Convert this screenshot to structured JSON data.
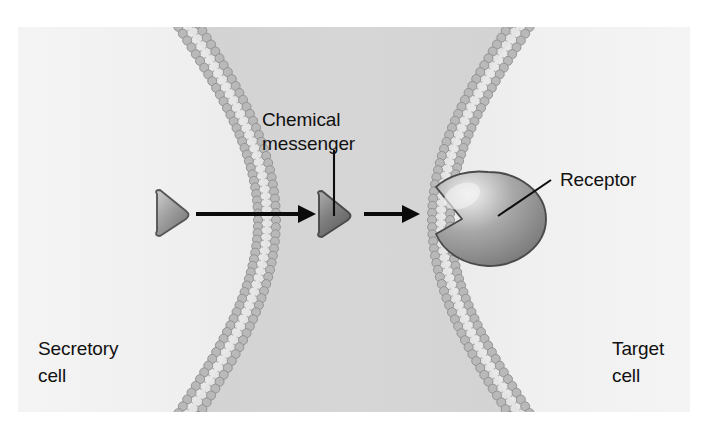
{
  "figure": {
    "canvas": {
      "width": 706,
      "height": 432
    },
    "panel": {
      "x": 18,
      "y": 27,
      "width": 672,
      "height": 385
    }
  },
  "colors": {
    "page_background": "#ffffff",
    "panel_background": "#e4e4e4",
    "cell_interior": "#f2f2f2",
    "intercellular_gap": "#d2d2d2",
    "membrane_head": "#b9b9b9",
    "membrane_head_stroke": "#8d8d8d",
    "membrane_tail": "#bdbdbd",
    "messenger_light": "#b7b7b7",
    "messenger_dark": "#6e6e6e",
    "messenger_outline": "#4f4f4f",
    "receptor_light": "#e8e8e8",
    "receptor_mid": "#9a9a9a",
    "receptor_dark": "#6f6f6f",
    "receptor_outline": "#4b4b4b",
    "ink": "#0b0b0b"
  },
  "labels": {
    "chemical_messenger": {
      "line1": "Chemical",
      "line2": "messenger",
      "x": 262,
      "y": 126
    },
    "receptor": {
      "text": "Receptor",
      "x": 560,
      "y": 186
    },
    "secretory_cell": {
      "line1": "Secretory",
      "line2": "cell",
      "x": 38,
      "y": 355
    },
    "target_cell": {
      "line1": "Target",
      "line2": "cell",
      "x": 612,
      "y": 355
    }
  },
  "cells": [
    {
      "name": "secretory-cell",
      "side": "left",
      "label": "Secretory cell",
      "membrane_curvature": "convex-right"
    },
    {
      "name": "target-cell",
      "side": "right",
      "label": "Target cell",
      "membrane_curvature": "convex-left"
    }
  ],
  "membranes": [
    {
      "name": "secretory-cell-membrane",
      "type": "phospholipid-bilayer",
      "lipid_head_count": 58,
      "description": "bilayer arc of the secretory cell, bulging toward the gap"
    },
    {
      "name": "target-cell-membrane",
      "type": "phospholipid-bilayer",
      "lipid_head_count": 58,
      "description": "bilayer arc of the target cell, bulging toward the gap"
    }
  ],
  "messengers": [
    {
      "name": "chemical-messenger-inside-cell",
      "shape": "triangle",
      "cx": 172,
      "cy": 215,
      "size": 21,
      "tone": "light"
    },
    {
      "name": "chemical-messenger-in-gap",
      "shape": "triangle",
      "cx": 334,
      "cy": 216,
      "size": 21,
      "tone": "dark"
    }
  ],
  "arrows": [
    {
      "name": "secretion-arrow",
      "from_x": 196,
      "to_x": 312,
      "y": 214,
      "description": "messenger released across the secretory cell membrane"
    },
    {
      "name": "binding-arrow",
      "from_x": 364,
      "to_x": 416,
      "y": 214,
      "description": "messenger moving toward the receptor binding site"
    }
  ],
  "receptor": {
    "name": "membrane-receptor",
    "shape": "ellipse-with-triangular-notch",
    "cx": 488,
    "cy": 219,
    "rx": 58,
    "ry": 47,
    "notch_side": "left",
    "embedded_in": "target-cell-membrane"
  }
}
